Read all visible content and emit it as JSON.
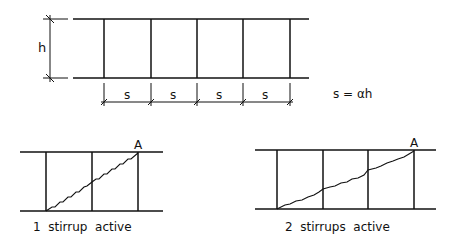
{
  "top_diagram": {
    "height_label": "h",
    "spacing_labels": [
      "s",
      "s",
      "s",
      "s"
    ],
    "formula": "s = αh"
  },
  "bottom_left": {
    "point_label": "A",
    "caption": "1  stirrup  active"
  },
  "bottom_right": {
    "point_label": "A",
    "caption": "2  stirrups  active"
  },
  "colors": {
    "line": "#111111",
    "background": "#ffffff"
  }
}
